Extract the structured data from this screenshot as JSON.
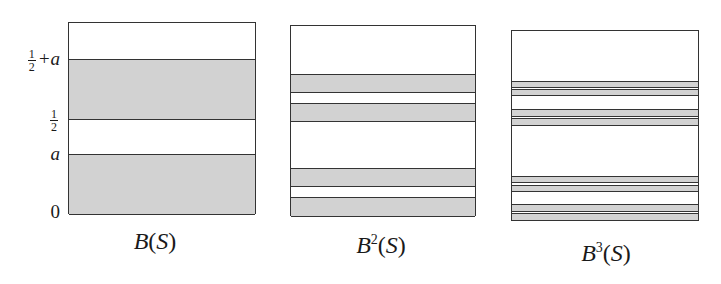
{
  "figure": {
    "colors": {
      "band_fill": "#d2d2d2",
      "line": "#333333",
      "background": "#ffffff"
    },
    "y_axis_labels": [
      {
        "id": "half-plus-a",
        "frac_num": "1",
        "frac_den": "2",
        "suffix": "+a",
        "y": 58
      },
      {
        "id": "half",
        "frac_num": "1",
        "frac_den": "2",
        "suffix": "",
        "y": 118
      },
      {
        "id": "a",
        "text": "a",
        "y": 154
      },
      {
        "id": "zero",
        "text": "0",
        "y": 212
      }
    ],
    "panels": [
      {
        "id": "B1",
        "caption": {
          "base": "B",
          "exp": "",
          "arg": "S"
        },
        "box": {
          "left": 68,
          "top": 22,
          "width": 188,
          "height": 192
        },
        "bands": [
          [
            58,
            119
          ],
          [
            153,
            214
          ]
        ]
      },
      {
        "id": "B2",
        "caption": {
          "base": "B",
          "exp": "2",
          "arg": "S"
        },
        "box": {
          "left": 290,
          "top": 25,
          "width": 186,
          "height": 191
        },
        "bands": [
          [
            73,
            92
          ],
          [
            102,
            121
          ],
          [
            167,
            186
          ],
          [
            196,
            216
          ]
        ]
      },
      {
        "id": "B3",
        "caption": {
          "base": "B",
          "exp": "3",
          "arg": "S"
        },
        "box": {
          "left": 511,
          "top": 30,
          "width": 188,
          "height": 191
        },
        "bands": [
          [
            80,
            87
          ],
          [
            88,
            95
          ],
          [
            108,
            116
          ],
          [
            117,
            125
          ],
          [
            175,
            182
          ],
          [
            184,
            191
          ],
          [
            203,
            211
          ],
          [
            212,
            220
          ]
        ]
      }
    ],
    "captions_pos": [
      {
        "x": 155,
        "y": 228
      },
      {
        "x": 381,
        "y": 232
      },
      {
        "x": 606,
        "y": 240
      }
    ]
  }
}
